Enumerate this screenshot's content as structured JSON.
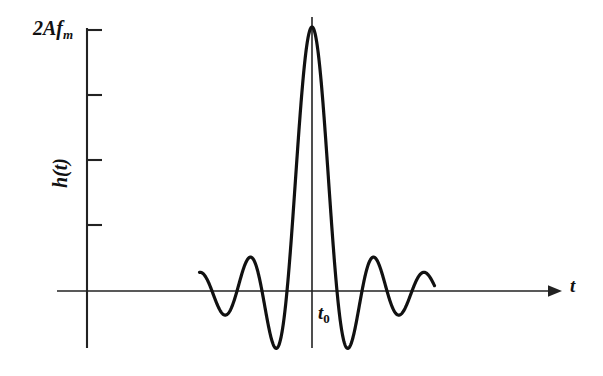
{
  "figure": {
    "background_color": "#ffffff",
    "ink_color": "#111111",
    "width": 603,
    "height": 376
  },
  "labels": {
    "y_peak_prefix": "2Af",
    "y_peak_subscript": "m",
    "y_axis": "h(t)",
    "x_axis": "t",
    "center_marker_prefix": "t",
    "center_marker_subscript": "0"
  },
  "chart_data": {
    "type": "line",
    "title": "",
    "xlabel": "t",
    "ylabel": "h(t)",
    "curve_function": "h(t) = 2Af_m * sinc(2f_m (t - t0))",
    "grid": false,
    "legend": false,
    "y_axis_ticks": [
      {
        "label": "2Af_m",
        "value": 1.0
      },
      {
        "label": "",
        "value": 0.75
      },
      {
        "label": "",
        "value": 0.5
      },
      {
        "label": "",
        "value": 0.25
      },
      {
        "label": "",
        "value": 0.0
      }
    ],
    "ylim": [
      -0.22,
      1.05
    ],
    "xlim": [
      -4.5,
      4.9
    ],
    "annotations": [
      {
        "text": "t0",
        "x": 0.0,
        "y": -0.1,
        "kind": "center-time-marker"
      },
      {
        "text": "2Af_m",
        "x": -4.5,
        "y": 1.0,
        "kind": "peak-amplitude-label"
      }
    ],
    "peak": {
      "x": 0.0,
      "y": 1.0,
      "label": "2Af_m"
    },
    "zero_crossings_x": [
      -4.0,
      -3.0,
      -2.0,
      -1.0,
      1.0,
      2.0,
      3.0,
      4.0
    ],
    "side_lobe_extrema": [
      {
        "x": -3.47,
        "y": -0.048
      },
      {
        "x": -2.46,
        "y": 0.085
      },
      {
        "x": -1.43,
        "y": -0.153
      },
      {
        "x": 1.43,
        "y": -0.153
      },
      {
        "x": 2.46,
        "y": 0.085
      },
      {
        "x": 3.47,
        "y": -0.048
      }
    ],
    "series": [
      {
        "name": "h(t)",
        "color": "#111111",
        "linewidth": 3.2,
        "x_start": -4.5,
        "x_end": 4.9,
        "samples": 900
      }
    ]
  },
  "geometry": {
    "origin_x": 87,
    "zero_line_y": 291,
    "center_line_x": 312,
    "peak_y": 27,
    "y_axis_top": 28,
    "y_axis_bottom": 348,
    "x_axis_left": 57,
    "x_axis_right": 555,
    "half_period_px": 25,
    "tick_length_px": 15,
    "tick_ys": [
      30,
      95,
      160,
      225,
      290
    ]
  }
}
